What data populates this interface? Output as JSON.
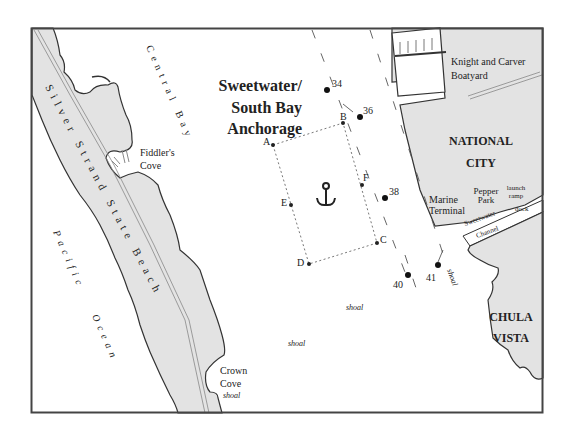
{
  "map": {
    "title_lines": [
      "Sweetwater/",
      "South Bay",
      "Anchorage"
    ],
    "places": {
      "central_bay": "Central Bay",
      "silver_strand": "Silver Strand State Beach",
      "silver_strand_parts": [
        "Silver",
        "Strand",
        "State",
        "Beach"
      ],
      "pacific": "Pacific",
      "ocean": "Ocean",
      "fiddlers_cove_1": "Fiddler's",
      "fiddlers_cove_2": "Cove",
      "knight_carver_1": "Knight and Carver",
      "knight_carver_2": "Boatyard",
      "national_city_1": "NATIONAL",
      "national_city_2": "CITY",
      "marine_terminal_1": "Marine",
      "marine_terminal_2": "Terminal",
      "pepper_park_1": "Pepper",
      "pepper_park_2": "Park",
      "launch_ramp_1": "launch",
      "launch_ramp_2": "ramp",
      "dock": "dock",
      "sweetwater_channel_1": "Sweetwater",
      "sweetwater_channel_2": "Channel",
      "chula_vista_1": "CHULA",
      "chula_vista_2": "VISTA",
      "crown_cove_1": "Crown",
      "crown_cove_2": "Cove"
    },
    "shoal_labels": [
      "shoal",
      "shoal",
      "shoal",
      "shoal"
    ],
    "anchorage_points": [
      "A",
      "B",
      "C",
      "D",
      "E",
      "F"
    ],
    "buoys": [
      "34",
      "36",
      "38",
      "40",
      "41"
    ],
    "colors": {
      "land": "#e3e3e3",
      "water": "#ffffff",
      "outline": "#333333",
      "frame": "#444444"
    }
  }
}
